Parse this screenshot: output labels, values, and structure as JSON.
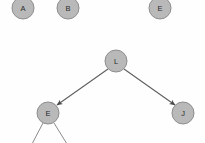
{
  "canvas": {
    "width": 205,
    "height": 143,
    "background": "#fefefe",
    "title": "binary-tree-graph"
  },
  "style": {
    "node_fill": "#b9b9b9",
    "node_stroke": "#8e8e8e",
    "node_radius": 11,
    "label_color": "#2a2a2a",
    "edge_color": "#5e5e5e",
    "edge_plain_color": "#8a8a8a"
  },
  "nodes": [
    {
      "id": "A",
      "label": "A",
      "cx": 23,
      "cy": 8,
      "r": 11,
      "clipped": "top"
    },
    {
      "id": "B",
      "label": "B",
      "cx": 68,
      "cy": 8,
      "r": 11,
      "clipped": "top"
    },
    {
      "id": "E1",
      "label": "E",
      "cx": 160,
      "cy": 8,
      "r": 11,
      "clipped": "top"
    },
    {
      "id": "L",
      "label": "L",
      "cx": 116,
      "cy": 61,
      "r": 11,
      "clipped": "none"
    },
    {
      "id": "E2",
      "label": "E",
      "cx": 48,
      "cy": 113,
      "r": 11,
      "clipped": "none"
    },
    {
      "id": "J",
      "label": "J",
      "cx": 183,
      "cy": 113,
      "r": 11,
      "clipped": "none"
    }
  ],
  "edges": [
    {
      "id": "L-E2",
      "from": "L",
      "to": "E2",
      "x1": 108,
      "y1": 69,
      "x2": 57,
      "y2": 105,
      "arrow": true
    },
    {
      "id": "L-J",
      "from": "L",
      "to": "J",
      "x1": 124,
      "y1": 69,
      "x2": 175,
      "y2": 105,
      "arrow": true
    },
    {
      "id": "E2-c1",
      "from": "E2",
      "to": "",
      "x1": 43,
      "y1": 124,
      "x2": 33,
      "y2": 143,
      "arrow": false
    },
    {
      "id": "E2-c2",
      "from": "E2",
      "to": "",
      "x1": 54,
      "y1": 124,
      "x2": 66,
      "y2": 143,
      "arrow": false
    }
  ]
}
